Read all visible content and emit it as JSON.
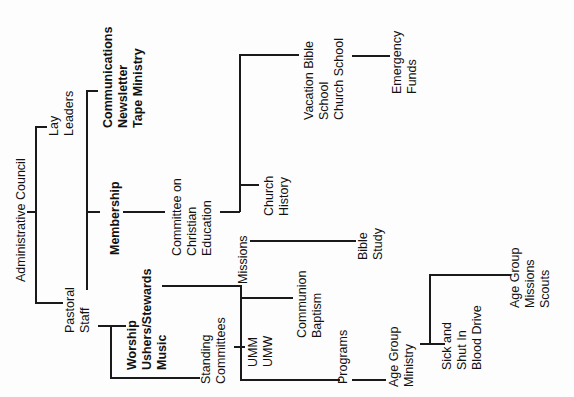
{
  "chart_type": "organizational-chart",
  "orientation": "rotated-90-ccw",
  "nodes": {
    "admin_council": {
      "lines": [
        "Administrative Council"
      ]
    },
    "lay_leaders": {
      "lines": [
        "Lay",
        "Leaders"
      ]
    },
    "communications": {
      "lines": [
        "Communications",
        "Newsletter",
        "Tape Ministry"
      ]
    },
    "membership": {
      "lines": [
        "Membership"
      ]
    },
    "committee_ce": {
      "lines": [
        "Committee on",
        "Christian",
        "Education"
      ]
    },
    "vbs": {
      "lines": [
        "Vacation Bible",
        "School",
        "Church School"
      ]
    },
    "emergency": {
      "lines": [
        "Emergency",
        "Funds"
      ]
    },
    "church_history": {
      "lines": [
        "Church",
        "History"
      ]
    },
    "missions": {
      "lines": [
        "Missions"
      ]
    },
    "bible_study": {
      "lines": [
        "Bible",
        "Study"
      ]
    },
    "pastoral_staff": {
      "lines": [
        "Pastoral",
        "Staff"
      ]
    },
    "worship": {
      "lines": [
        "Worship",
        "Ushers/Stewards",
        "Music"
      ]
    },
    "communion": {
      "lines": [
        "Communion",
        "Baptism"
      ]
    },
    "standing_committees": {
      "lines": [
        "Standing",
        "Committees"
      ]
    },
    "umm": {
      "lines": [
        "UMM",
        "UMW"
      ]
    },
    "programs": {
      "lines": [
        "Programs"
      ]
    },
    "age_group_ministry": {
      "lines": [
        "Age Group",
        "Ministry"
      ]
    },
    "sick": {
      "lines": [
        "Sick and",
        "Shut In",
        "Blood Drive"
      ]
    },
    "age_group_missions": {
      "lines": [
        "Age Group",
        "Missions",
        "Scouts"
      ]
    }
  },
  "edges": [
    [
      "admin_council",
      "lay_leaders"
    ],
    [
      "admin_council",
      "pastoral_staff"
    ],
    [
      "lay_leaders",
      "communications"
    ],
    [
      "lay_leaders",
      "membership"
    ],
    [
      "membership",
      "committee_ce"
    ],
    [
      "committee_ce",
      "vbs"
    ],
    [
      "committee_ce",
      "church_history"
    ],
    [
      "committee_ce",
      "missions"
    ],
    [
      "vbs",
      "emergency"
    ],
    [
      "missions",
      "bible_study"
    ],
    [
      "worship",
      "communion"
    ],
    [
      "worship",
      "umm"
    ],
    [
      "worship",
      "programs"
    ],
    [
      "pastoral_staff",
      "worship"
    ],
    [
      "pastoral_staff",
      "standing_committees"
    ],
    [
      "programs",
      "age_group_ministry"
    ],
    [
      "age_group_ministry",
      "sick"
    ],
    [
      "age_group_ministry",
      "age_group_missions"
    ]
  ]
}
